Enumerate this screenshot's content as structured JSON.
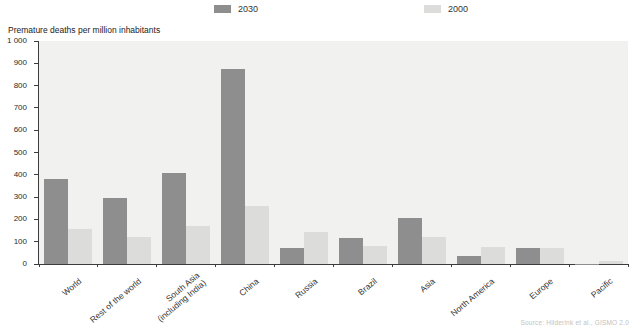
{
  "legend": {
    "items": [
      {
        "label": "2030",
        "color": "#8e8e8e"
      },
      {
        "label": "2000",
        "color": "#dcdcda"
      }
    ]
  },
  "chart_data": {
    "type": "bar",
    "title": "",
    "ylabel": "Premature deaths per million inhabitants",
    "xlabel": "",
    "categories": [
      "World",
      "Rest of the world",
      "South Asia\n(including India)",
      "China",
      "Russia",
      "Brazil",
      "Asia",
      "North America",
      "Europe",
      "Pacific"
    ],
    "series": [
      {
        "name": "2030",
        "color": "#8e8e8e",
        "values": [
          380,
          295,
          410,
          875,
          70,
          115,
          205,
          35,
          70,
          2
        ]
      },
      {
        "name": "2000",
        "color": "#dcdcda",
        "values": [
          155,
          120,
          170,
          260,
          145,
          80,
          120,
          75,
          70,
          15
        ]
      }
    ],
    "ylim": [
      0,
      1000
    ],
    "ytick_step": 100,
    "ytick_labels": [
      "0",
      "100",
      "200",
      "300",
      "400",
      "500",
      "600",
      "700",
      "800",
      "900",
      "1 000"
    ],
    "grid": false,
    "legend_position": "top"
  },
  "footer": {
    "source": "Source: Hilderink et al., GISMO 2.0"
  }
}
